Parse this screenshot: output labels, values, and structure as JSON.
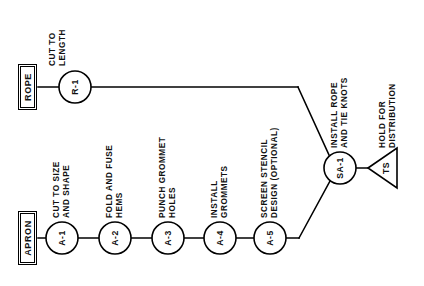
{
  "diagram": {
    "background_color": "#ffffff",
    "line_color": "#000000",
    "text_color": "#111111"
  },
  "sources": [
    {
      "id": "rope-source",
      "label": "ROPE"
    },
    {
      "id": "apron-source",
      "label": "APRON"
    }
  ],
  "rope_line": {
    "nodes": [
      {
        "id": "R-1",
        "label": "R-1",
        "caption": [
          "CUT TO",
          "LENGTH"
        ]
      }
    ]
  },
  "apron_line": {
    "nodes": [
      {
        "id": "A-1",
        "label": "A-1",
        "caption": [
          "CUT TO SIZE",
          "AND SHAPE"
        ]
      },
      {
        "id": "A-2",
        "label": "A-2",
        "caption": [
          "FOLD AND FUSE",
          "HEMS"
        ]
      },
      {
        "id": "A-3",
        "label": "A-3",
        "caption": [
          "PUNCH GROMMET",
          "HOLES"
        ]
      },
      {
        "id": "A-4",
        "label": "A-4",
        "caption": [
          "INSTALL",
          "GROMMETS"
        ]
      },
      {
        "id": "A-5",
        "label": "A-5",
        "caption": [
          "SCREEN STENCIL",
          "DESIGN (OPTIONAL)"
        ]
      }
    ]
  },
  "assembly": {
    "node": {
      "id": "SA-1",
      "label": "SA-1",
      "caption": [
        "INSTALL ROPE",
        "AND TIE KNOTS"
      ]
    }
  },
  "storage": {
    "node": {
      "id": "TS",
      "label": "TS",
      "caption": [
        "HOLD FOR",
        "DISTRIBUTION"
      ]
    }
  }
}
